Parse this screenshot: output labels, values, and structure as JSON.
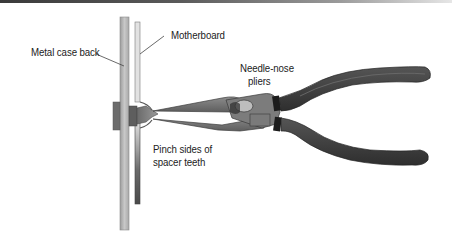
{
  "figure": {
    "labels": {
      "metal_case_back": "Metal case back",
      "motherboard": "Motherboard",
      "pliers_line1": "Needle-nose",
      "pliers_line2": "pliers",
      "pinch_line1": "Pinch sides of",
      "pinch_line2": "spacer teeth"
    },
    "colors": {
      "case_back": "#b8b8b8",
      "motherboard": "#6e6e6e",
      "pliers_jaw": "#7a7a7a",
      "pliers_handle": "#3c3c3c",
      "text": "#222222"
    }
  }
}
